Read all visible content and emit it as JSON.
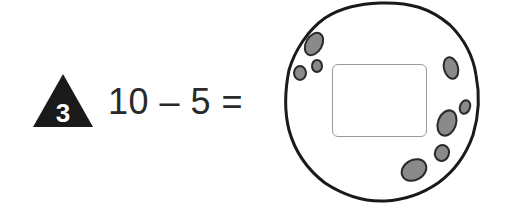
{
  "problem": {
    "number": "3",
    "expression": "10 – 5 =",
    "answer_value": ""
  },
  "colors": {
    "badge_fill": "#1a1a1a",
    "badge_text": "#ffffff",
    "rock_outline": "#1a1a1a",
    "crater_fill": "#8a8a8a",
    "answer_box_border": "#9a9a9a"
  }
}
